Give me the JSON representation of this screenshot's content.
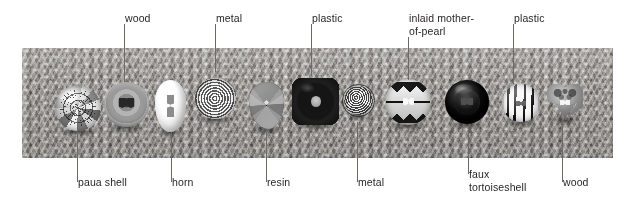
{
  "figure": {
    "background_color": "#ffffff",
    "leader_color": "#6d6a66",
    "text_color": "#231f20"
  },
  "photo": {
    "name": "button-strip-photograph",
    "fabric": "knitted textured fabric backdrop",
    "x": 22,
    "y": 48,
    "width": 591,
    "height": 110
  },
  "callouts_top": [
    {
      "label": "wood",
      "leader_x": 124,
      "text_x": 125,
      "text_y": 12,
      "leader_top": 24,
      "leader_bottom": 82
    },
    {
      "label": "metal",
      "leader_x": 215,
      "text_x": 216,
      "text_y": 12,
      "leader_top": 24,
      "leader_bottom": 72
    },
    {
      "label": "plastic",
      "leader_x": 311,
      "text_x": 312,
      "text_y": 12,
      "leader_top": 24,
      "leader_bottom": 76
    },
    {
      "label": "inlaid mother-\nof-pearl",
      "leader_x": 408,
      "text_x": 409,
      "text_y": 12,
      "leader_top": 37,
      "leader_bottom": 80
    },
    {
      "label": "plastic",
      "leader_x": 513,
      "text_x": 514,
      "text_y": 12,
      "leader_top": 24,
      "leader_bottom": 84
    }
  ],
  "callouts_bottom": [
    {
      "label": "paua shell",
      "leader_x": 77,
      "text_x": 78,
      "text_y": 182,
      "leader_top": 122,
      "leader_bottom": 182
    },
    {
      "label": "horn",
      "leader_x": 171,
      "text_x": 172,
      "text_y": 182,
      "leader_top": 132,
      "leader_bottom": 182
    },
    {
      "label": "resin",
      "leader_x": 266,
      "text_x": 267,
      "text_y": 182,
      "leader_top": 130,
      "leader_bottom": 182
    },
    {
      "label": "metal",
      "leader_x": 357,
      "text_x": 358,
      "text_y": 182,
      "leader_top": 122,
      "leader_bottom": 182
    },
    {
      "label": "faux\ntortoiseshell",
      "leader_x": 468,
      "text_x": 469,
      "text_y": 174,
      "leader_top": 126,
      "leader_bottom": 174
    },
    {
      "label": "wood",
      "leader_x": 562,
      "text_x": 563,
      "text_y": 182,
      "leader_top": 122,
      "leader_bottom": 182
    }
  ],
  "buttons": [
    {
      "material": "paua shell",
      "shape": "round mosaic dome",
      "x": 55,
      "y": 85,
      "w": 46,
      "h": 46
    },
    {
      "material": "wood",
      "shape": "round dished two-hole",
      "x": 104,
      "y": 82,
      "w": 45,
      "h": 45
    },
    {
      "material": "horn",
      "shape": "elongated white oval",
      "x": 155,
      "y": 80,
      "w": 31,
      "h": 52
    },
    {
      "material": "metal",
      "shape": "notched rim spiral disc",
      "x": 195,
      "y": 78,
      "w": 41,
      "h": 41
    },
    {
      "material": "resin",
      "shape": "dark leaf",
      "x": 249,
      "y": 82,
      "w": 35,
      "h": 47
    },
    {
      "material": "plastic",
      "shape": "black quatrefoil",
      "x": 292,
      "y": 78,
      "w": 47,
      "h": 47
    },
    {
      "material": "metal",
      "shape": "small perforated dome",
      "x": 344,
      "y": 86,
      "w": 29,
      "h": 29
    },
    {
      "material": "inlaid mother-of-pearl",
      "shape": "zigzag inlaid disc",
      "x": 385,
      "y": 79,
      "w": 46,
      "h": 46
    },
    {
      "material": "faux tortoiseshell",
      "shape": "dark glossy round",
      "x": 445,
      "y": 80,
      "w": 44,
      "h": 44
    },
    {
      "material": "plastic",
      "shape": "black and white striped round",
      "x": 502,
      "y": 84,
      "w": 38,
      "h": 38
    },
    {
      "material": "wood",
      "shape": "carved heart",
      "x": 547,
      "y": 84,
      "w": 36,
      "h": 36
    }
  ]
}
